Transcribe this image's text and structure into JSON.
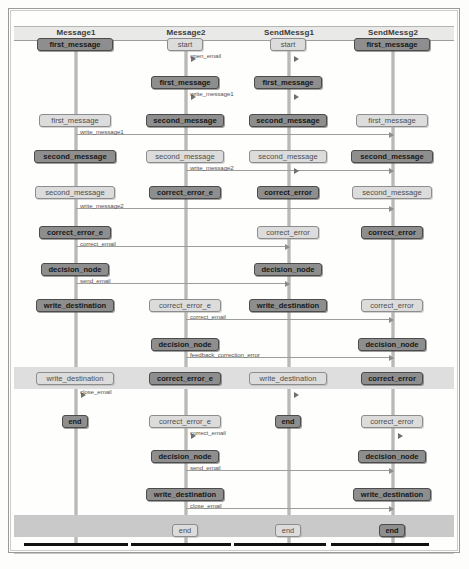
{
  "diagram": {
    "type": "sequence-diagram",
    "lanes": [
      {
        "id": "lane1",
        "label": "Message1",
        "x": 76
      },
      {
        "id": "lane2",
        "label": "Message2",
        "x": 186
      },
      {
        "id": "lane3",
        "label": "SendMessg1",
        "x": 289
      },
      {
        "id": "lane4",
        "label": "SendMessg2",
        "x": 393
      }
    ],
    "colors": {
      "node_dark_fill": "#8e8e8e",
      "node_light_fill": "#dcdcdc",
      "node_border": "#4c4c4c",
      "lifeline": "#b9b9b7",
      "arrow": "#9d9d9b",
      "header_band": "#e9e9e7",
      "highlight_band": "#dedede",
      "end_band": "#c9c9c9",
      "end_bar": "#111111"
    },
    "nodes": [
      {
        "lane": 1,
        "y": 38,
        "w": 76,
        "label": "first_message",
        "style": "dark"
      },
      {
        "lane": 1,
        "y": 114,
        "w": 72,
        "label": "first_message",
        "style": "light"
      },
      {
        "lane": 1,
        "y": 150,
        "w": 82,
        "label": "second_message",
        "style": "dark"
      },
      {
        "lane": 1,
        "y": 186,
        "w": 80,
        "label": "second_message",
        "style": "light"
      },
      {
        "lane": 1,
        "y": 226,
        "w": 72,
        "label": "correct_error_e",
        "style": "dark"
      },
      {
        "lane": 1,
        "y": 263,
        "w": 68,
        "label": "decision_node",
        "style": "dark"
      },
      {
        "lane": 1,
        "y": 299,
        "w": 78,
        "label": "write_destination",
        "style": "dark"
      },
      {
        "lane": 1,
        "y": 372,
        "w": 78,
        "label": "write_destination",
        "style": "light"
      },
      {
        "lane": 1,
        "y": 415,
        "w": 26,
        "label": "end",
        "style": "dark"
      },
      {
        "lane": 2,
        "y": 38,
        "w": 36,
        "label": "start",
        "style": "light"
      },
      {
        "lane": 2,
        "y": 76,
        "w": 68,
        "label": "first_message",
        "style": "dark"
      },
      {
        "lane": 2,
        "y": 114,
        "w": 78,
        "label": "second_message",
        "style": "dark"
      },
      {
        "lane": 2,
        "y": 150,
        "w": 78,
        "label": "second_message",
        "style": "light"
      },
      {
        "lane": 2,
        "y": 186,
        "w": 72,
        "label": "correct_error_e",
        "style": "dark"
      },
      {
        "lane": 2,
        "y": 299,
        "w": 72,
        "label": "correct_error_e",
        "style": "light"
      },
      {
        "lane": 2,
        "y": 338,
        "w": 68,
        "label": "decision_node",
        "style": "dark"
      },
      {
        "lane": 2,
        "y": 372,
        "w": 72,
        "label": "correct_error_e",
        "style": "dark"
      },
      {
        "lane": 2,
        "y": 415,
        "w": 72,
        "label": "correct_error_e",
        "style": "light"
      },
      {
        "lane": 2,
        "y": 450,
        "w": 68,
        "label": "decision_node",
        "style": "dark"
      },
      {
        "lane": 2,
        "y": 488,
        "w": 78,
        "label": "write_destination",
        "style": "dark"
      },
      {
        "lane": 2,
        "y": 524,
        "w": 26,
        "label": "end",
        "style": "light"
      },
      {
        "lane": 3,
        "y": 38,
        "w": 36,
        "label": "start",
        "style": "light"
      },
      {
        "lane": 3,
        "y": 76,
        "w": 68,
        "label": "first_message",
        "style": "dark"
      },
      {
        "lane": 3,
        "y": 114,
        "w": 78,
        "label": "second_message",
        "style": "dark"
      },
      {
        "lane": 3,
        "y": 150,
        "w": 78,
        "label": "second_message",
        "style": "light"
      },
      {
        "lane": 3,
        "y": 186,
        "w": 62,
        "label": "correct_error",
        "style": "dark"
      },
      {
        "lane": 3,
        "y": 226,
        "w": 62,
        "label": "correct_error",
        "style": "light"
      },
      {
        "lane": 3,
        "y": 263,
        "w": 68,
        "label": "decision_node",
        "style": "dark"
      },
      {
        "lane": 3,
        "y": 299,
        "w": 78,
        "label": "write_destination",
        "style": "dark"
      },
      {
        "lane": 3,
        "y": 372,
        "w": 78,
        "label": "write_destination",
        "style": "light"
      },
      {
        "lane": 3,
        "y": 415,
        "w": 26,
        "label": "end",
        "style": "dark"
      },
      {
        "lane": 3,
        "y": 524,
        "w": 26,
        "label": "end",
        "style": "light"
      },
      {
        "lane": 4,
        "y": 38,
        "w": 76,
        "label": "first_message",
        "style": "dark"
      },
      {
        "lane": 4,
        "y": 114,
        "w": 72,
        "label": "first_message",
        "style": "light"
      },
      {
        "lane": 4,
        "y": 150,
        "w": 82,
        "label": "second_message",
        "style": "dark"
      },
      {
        "lane": 4,
        "y": 186,
        "w": 80,
        "label": "second_message",
        "style": "light"
      },
      {
        "lane": 4,
        "y": 226,
        "w": 62,
        "label": "correct_error",
        "style": "dark"
      },
      {
        "lane": 4,
        "y": 299,
        "w": 62,
        "label": "correct_error",
        "style": "light"
      },
      {
        "lane": 4,
        "y": 338,
        "w": 68,
        "label": "decision_node",
        "style": "dark"
      },
      {
        "lane": 4,
        "y": 372,
        "w": 62,
        "label": "correct_error",
        "style": "dark"
      },
      {
        "lane": 4,
        "y": 415,
        "w": 62,
        "label": "correct_error",
        "style": "light"
      },
      {
        "lane": 4,
        "y": 450,
        "w": 68,
        "label": "decision_node",
        "style": "dark"
      },
      {
        "lane": 4,
        "y": 488,
        "w": 78,
        "label": "write_destination",
        "style": "dark"
      },
      {
        "lane": 4,
        "y": 524,
        "w": 26,
        "label": "end",
        "style": "dark"
      }
    ],
    "arrows": [
      {
        "y": 58,
        "from": 186,
        "to": 186,
        "label": "open_email",
        "lx": 190,
        "ly": 52,
        "stub": true
      },
      {
        "y": 58,
        "from": 289,
        "to": 289,
        "label": "",
        "lx": 293,
        "ly": 52,
        "stub": true
      },
      {
        "y": 96,
        "from": 186,
        "to": 186,
        "label": "write_message1",
        "lx": 190,
        "ly": 90,
        "stub": true
      },
      {
        "y": 96,
        "from": 289,
        "to": 289,
        "label": "",
        "lx": 293,
        "ly": 90,
        "stub": true
      },
      {
        "y": 134,
        "from": 76,
        "to": 393,
        "label": "write_message1",
        "lx": 80,
        "ly": 128,
        "stub": false
      },
      {
        "y": 170,
        "from": 186,
        "to": 393,
        "label": "write_message2",
        "lx": 190,
        "ly": 164,
        "stub": false
      },
      {
        "y": 170,
        "from": 289,
        "to": 289,
        "label": "",
        "lx": 293,
        "ly": 164,
        "stub": true
      },
      {
        "y": 208,
        "from": 76,
        "to": 393,
        "label": "write_message2",
        "lx": 80,
        "ly": 202,
        "stub": false
      },
      {
        "y": 246,
        "from": 76,
        "to": 289,
        "label": "correct_email",
        "lx": 80,
        "ly": 240,
        "stub": false
      },
      {
        "y": 283,
        "from": 76,
        "to": 289,
        "label": "send_email",
        "lx": 80,
        "ly": 277,
        "stub": false
      },
      {
        "y": 319,
        "from": 186,
        "to": 393,
        "label": "correct_email",
        "lx": 190,
        "ly": 313,
        "stub": false
      },
      {
        "y": 357,
        "from": 186,
        "to": 393,
        "label": "feedback_correction_error",
        "lx": 190,
        "ly": 351,
        "stub": false
      },
      {
        "y": 394,
        "from": 76,
        "to": 76,
        "label": "close_email",
        "lx": 80,
        "ly": 388,
        "stub": true
      },
      {
        "y": 394,
        "from": 289,
        "to": 289,
        "label": "",
        "lx": 293,
        "ly": 388,
        "stub": true
      },
      {
        "y": 435,
        "from": 186,
        "to": 186,
        "label": "correct_email",
        "lx": 190,
        "ly": 429,
        "stub": true
      },
      {
        "y": 435,
        "from": 393,
        "to": 393,
        "label": "",
        "lx": 397,
        "ly": 429,
        "stub": true
      },
      {
        "y": 470,
        "from": 186,
        "to": 393,
        "label": "send_email",
        "lx": 190,
        "ly": 464,
        "stub": false
      },
      {
        "y": 508,
        "from": 186,
        "to": 393,
        "label": "close_email",
        "lx": 190,
        "ly": 502,
        "stub": false
      }
    ],
    "highlight_bands": [
      {
        "y": 367,
        "h": 22
      },
      {
        "y": 515,
        "h": 22
      }
    ],
    "end_bars": [
      {
        "x": 24,
        "w": 104
      },
      {
        "x": 131,
        "w": 100
      },
      {
        "x": 234,
        "w": 92
      },
      {
        "x": 331,
        "w": 98
      }
    ]
  }
}
